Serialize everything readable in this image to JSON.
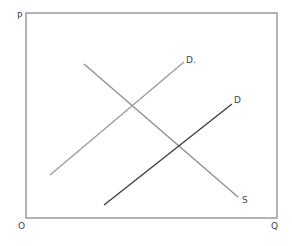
{
  "diagram": {
    "type": "supply-demand",
    "axis_labels": {
      "y": "P",
      "x": "Q",
      "origin": "O"
    },
    "frame": {
      "x1": 26,
      "y1": 13,
      "x2": 277,
      "y2": 218,
      "color": "#8a8a8a"
    },
    "curves": [
      {
        "id": "supply",
        "label": "S",
        "x1": 84,
        "y1": 64,
        "x2": 238,
        "y2": 197,
        "color": "#8c8c8c",
        "width": 1.3,
        "label_x": 242,
        "label_y": 196
      },
      {
        "id": "demand-original",
        "label": "D.",
        "x1": 50,
        "y1": 175,
        "x2": 184,
        "y2": 62,
        "color": "#9a9a9a",
        "width": 1.3,
        "label_x": 186,
        "label_y": 56
      },
      {
        "id": "demand-shifted",
        "label": "D",
        "x1": 104,
        "y1": 205,
        "x2": 232,
        "y2": 104,
        "color": "#3a3a3a",
        "width": 1.3,
        "label_x": 234,
        "label_y": 96
      }
    ],
    "label_positions": {
      "P": {
        "x": 17,
        "y": 12
      },
      "O": {
        "x": 18,
        "y": 222
      },
      "Q": {
        "x": 271,
        "y": 222
      }
    }
  }
}
